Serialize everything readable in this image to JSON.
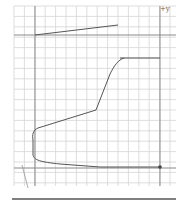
{
  "diagram": {
    "axis_label": "+y",
    "colors": {
      "grid": "#d4d4d4",
      "axis": "#8a8a8a",
      "curve": "#555555",
      "rule": "#555555",
      "point": "#444444"
    },
    "grid": {
      "x_start": 14,
      "y_start": 6,
      "step": 10.4,
      "x_end": 176,
      "y_end": 186
    },
    "axes": {
      "vertical": [
        35,
        160
      ],
      "horizontal": [
        35,
        168
      ]
    },
    "curve_points": "M35,35 L118,25 M120,58 L124,58 L160,58 M124,58 C118,60 114,66 110,74 L96,110 L38,128 C33,130 32,135 33,140 L33,155 C34,160 40,162 60,164 L100,167 L160,167",
    "thin_lines": "M22,165 L28,188",
    "point": {
      "x": 160,
      "y": 167
    },
    "bottom_rule": {
      "x1": 12,
      "x2": 176,
      "y": 199
    }
  }
}
